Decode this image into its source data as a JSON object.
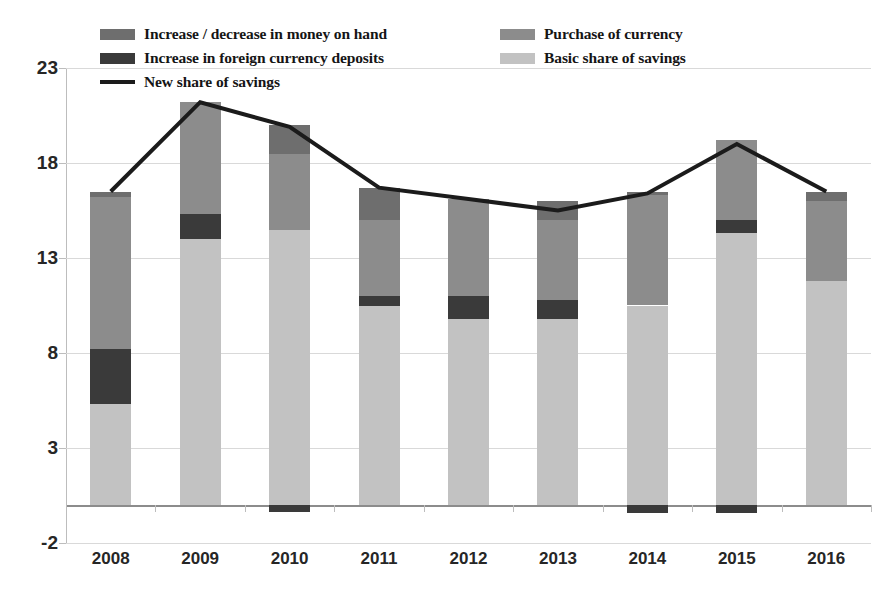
{
  "legend": {
    "items": [
      {
        "label": "Increase / decrease in money on hand",
        "key": "money_on_hand",
        "color": "#6e6e6e",
        "type": "swatch",
        "column": "left"
      },
      {
        "label": "Increase in foreign currency deposits",
        "key": "fx_deposits",
        "color": "#3a3a3a",
        "type": "swatch",
        "column": "left"
      },
      {
        "label": "New share of savings",
        "key": "new_share",
        "color": "#1b1b1b",
        "type": "line",
        "column": "left"
      },
      {
        "label": "Purchase of currency",
        "key": "purchase_currency",
        "color": "#8c8c8c",
        "type": "swatch",
        "column": "right"
      },
      {
        "label": "Basic share of savings",
        "key": "basic_share",
        "color": "#c2c2c2",
        "type": "swatch",
        "column": "right"
      }
    ]
  },
  "chart_data": {
    "type": "bar",
    "title": "",
    "subtitle": "",
    "xlabel": "",
    "ylabel": "",
    "stacked": true,
    "grid": true,
    "legend_position": "top",
    "categories": [
      "2008",
      "2009",
      "2010",
      "2011",
      "2012",
      "2013",
      "2014",
      "2015",
      "2016"
    ],
    "ylim": [
      -2,
      23
    ],
    "yticks": [
      -2,
      3,
      8,
      13,
      18,
      23
    ],
    "ytick_labels": [
      "-2",
      "3",
      "8",
      "13",
      "18",
      "23"
    ],
    "series": [
      {
        "name": "Basic share of savings",
        "key": "basic_share",
        "color": "#c2c2c2",
        "type": "bar",
        "values": [
          5.3,
          14.0,
          14.5,
          10.5,
          9.8,
          9.8,
          10.5,
          14.3,
          11.8
        ]
      },
      {
        "name": "Increase in foreign currency deposits",
        "key": "fx_deposits",
        "color": "#3a3a3a",
        "type": "bar",
        "values": [
          2.9,
          1.3,
          0.0,
          0.5,
          1.2,
          1.0,
          0.0,
          0.7,
          0.0
        ]
      },
      {
        "name": "Purchase of currency",
        "key": "purchase_currency",
        "color": "#8c8c8c",
        "type": "bar",
        "values": [
          8.0,
          5.9,
          4.0,
          4.0,
          5.1,
          4.2,
          5.8,
          4.2,
          4.2
        ]
      },
      {
        "name": "Increase / decrease in money on hand",
        "key": "money_on_hand",
        "color": "#6e6e6e",
        "type": "bar",
        "values": [
          0.3,
          0.0,
          1.5,
          1.7,
          0.0,
          1.0,
          0.2,
          0.0,
          0.5
        ]
      },
      {
        "name": "Increase / decrease in money on hand (negative)",
        "key": "money_on_hand_negative",
        "color": "#3a3a3a",
        "type": "bar",
        "values": [
          0.0,
          0.0,
          -0.35,
          0.0,
          0.0,
          0.0,
          -0.4,
          -0.4,
          0.0
        ]
      },
      {
        "name": "New share of savings",
        "key": "new_share",
        "color": "#1b1b1b",
        "type": "line",
        "values": [
          16.5,
          21.2,
          19.9,
          16.7,
          16.1,
          15.5,
          16.4,
          19.0,
          16.5
        ]
      }
    ]
  }
}
